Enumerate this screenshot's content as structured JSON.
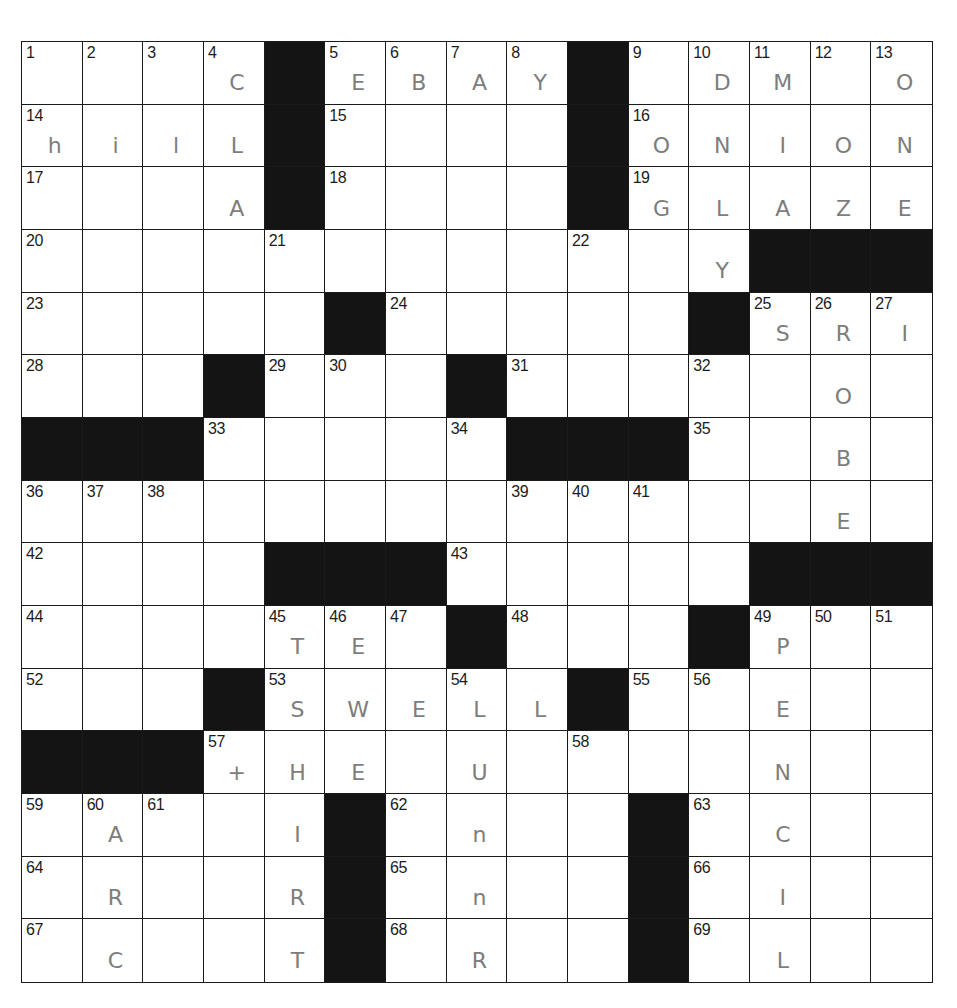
{
  "puzzle": {
    "rows": 15,
    "cols": 15,
    "colors": {
      "block": "#141414",
      "grid_line": "#1a1a1a",
      "pencil": "#7d7d7d",
      "number": "#1c1c1c"
    },
    "grid": [
      [
        {
          "n": "1",
          "v": ""
        },
        {
          "n": "2",
          "v": ""
        },
        {
          "n": "3",
          "v": ""
        },
        {
          "n": "4",
          "v": "C"
        },
        {
          "b": true
        },
        {
          "n": "5",
          "v": "E"
        },
        {
          "n": "6",
          "v": "B"
        },
        {
          "n": "7",
          "v": "A"
        },
        {
          "n": "8",
          "v": "Y"
        },
        {
          "b": true
        },
        {
          "n": "9",
          "v": ""
        },
        {
          "n": "10",
          "v": "D"
        },
        {
          "n": "11",
          "v": "M"
        },
        {
          "n": "12",
          "v": ""
        },
        {
          "n": "13",
          "v": "O"
        }
      ],
      [
        {
          "n": "14",
          "v": "h"
        },
        {
          "n": "",
          "v": "i"
        },
        {
          "n": "",
          "v": "l"
        },
        {
          "n": "",
          "v": "L"
        },
        {
          "b": true
        },
        {
          "n": "15",
          "v": ""
        },
        {
          "n": "",
          "v": ""
        },
        {
          "n": "",
          "v": ""
        },
        {
          "n": "",
          "v": ""
        },
        {
          "b": true
        },
        {
          "n": "16",
          "v": "O"
        },
        {
          "n": "",
          "v": "N"
        },
        {
          "n": "",
          "v": "I"
        },
        {
          "n": "",
          "v": "O"
        },
        {
          "n": "",
          "v": "N"
        }
      ],
      [
        {
          "n": "17",
          "v": ""
        },
        {
          "n": "",
          "v": ""
        },
        {
          "n": "",
          "v": ""
        },
        {
          "n": "",
          "v": "A"
        },
        {
          "b": true
        },
        {
          "n": "18",
          "v": ""
        },
        {
          "n": "",
          "v": ""
        },
        {
          "n": "",
          "v": ""
        },
        {
          "n": "",
          "v": ""
        },
        {
          "b": true
        },
        {
          "n": "19",
          "v": "G"
        },
        {
          "n": "",
          "v": "L"
        },
        {
          "n": "",
          "v": "A"
        },
        {
          "n": "",
          "v": "Z"
        },
        {
          "n": "",
          "v": "E"
        }
      ],
      [
        {
          "n": "20",
          "v": ""
        },
        {
          "n": "",
          "v": ""
        },
        {
          "n": "",
          "v": ""
        },
        {
          "n": "",
          "v": ""
        },
        {
          "n": "21",
          "v": ""
        },
        {
          "n": "",
          "v": ""
        },
        {
          "n": "",
          "v": ""
        },
        {
          "n": "",
          "v": ""
        },
        {
          "n": "",
          "v": ""
        },
        {
          "n": "22",
          "v": ""
        },
        {
          "n": "",
          "v": ""
        },
        {
          "n": "",
          "v": "Y"
        },
        {
          "b": true
        },
        {
          "b": true
        },
        {
          "b": true
        }
      ],
      [
        {
          "n": "23",
          "v": ""
        },
        {
          "n": "",
          "v": ""
        },
        {
          "n": "",
          "v": ""
        },
        {
          "n": "",
          "v": ""
        },
        {
          "n": "",
          "v": ""
        },
        {
          "b": true
        },
        {
          "n": "24",
          "v": ""
        },
        {
          "n": "",
          "v": ""
        },
        {
          "n": "",
          "v": ""
        },
        {
          "n": "",
          "v": ""
        },
        {
          "n": "",
          "v": ""
        },
        {
          "b": true
        },
        {
          "n": "25",
          "v": "S"
        },
        {
          "n": "26",
          "v": "R"
        },
        {
          "n": "27",
          "v": "I"
        }
      ],
      [
        {
          "n": "28",
          "v": ""
        },
        {
          "n": "",
          "v": ""
        },
        {
          "n": "",
          "v": ""
        },
        {
          "b": true
        },
        {
          "n": "29",
          "v": ""
        },
        {
          "n": "30",
          "v": ""
        },
        {
          "n": "",
          "v": ""
        },
        {
          "b": true
        },
        {
          "n": "31",
          "v": ""
        },
        {
          "n": "",
          "v": ""
        },
        {
          "n": "",
          "v": ""
        },
        {
          "n": "32",
          "v": ""
        },
        {
          "n": "",
          "v": ""
        },
        {
          "n": "",
          "v": "O"
        },
        {
          "n": "",
          "v": ""
        }
      ],
      [
        {
          "b": true
        },
        {
          "b": true
        },
        {
          "b": true
        },
        {
          "n": "33",
          "v": ""
        },
        {
          "n": "",
          "v": ""
        },
        {
          "n": "",
          "v": ""
        },
        {
          "n": "",
          "v": ""
        },
        {
          "n": "34",
          "v": ""
        },
        {
          "b": true
        },
        {
          "b": true
        },
        {
          "b": true
        },
        {
          "n": "35",
          "v": ""
        },
        {
          "n": "",
          "v": ""
        },
        {
          "n": "",
          "v": "B"
        },
        {
          "n": "",
          "v": ""
        }
      ],
      [
        {
          "n": "36",
          "v": ""
        },
        {
          "n": "37",
          "v": ""
        },
        {
          "n": "38",
          "v": ""
        },
        {
          "n": "",
          "v": ""
        },
        {
          "n": "",
          "v": ""
        },
        {
          "n": "",
          "v": ""
        },
        {
          "n": "",
          "v": ""
        },
        {
          "n": "",
          "v": ""
        },
        {
          "n": "39",
          "v": ""
        },
        {
          "n": "40",
          "v": ""
        },
        {
          "n": "41",
          "v": ""
        },
        {
          "n": "",
          "v": ""
        },
        {
          "n": "",
          "v": ""
        },
        {
          "n": "",
          "v": "E"
        },
        {
          "n": "",
          "v": ""
        }
      ],
      [
        {
          "n": "42",
          "v": ""
        },
        {
          "n": "",
          "v": ""
        },
        {
          "n": "",
          "v": ""
        },
        {
          "n": "",
          "v": ""
        },
        {
          "b": true
        },
        {
          "b": true
        },
        {
          "b": true
        },
        {
          "n": "43",
          "v": ""
        },
        {
          "n": "",
          "v": ""
        },
        {
          "n": "",
          "v": ""
        },
        {
          "n": "",
          "v": ""
        },
        {
          "n": "",
          "v": ""
        },
        {
          "b": true
        },
        {
          "b": true
        },
        {
          "b": true
        }
      ],
      [
        {
          "n": "44",
          "v": ""
        },
        {
          "n": "",
          "v": ""
        },
        {
          "n": "",
          "v": ""
        },
        {
          "n": "",
          "v": ""
        },
        {
          "n": "45",
          "v": "T"
        },
        {
          "n": "46",
          "v": "E"
        },
        {
          "n": "47",
          "v": ""
        },
        {
          "b": true
        },
        {
          "n": "48",
          "v": ""
        },
        {
          "n": "",
          "v": ""
        },
        {
          "n": "",
          "v": ""
        },
        {
          "b": true
        },
        {
          "n": "49",
          "v": "P"
        },
        {
          "n": "50",
          "v": ""
        },
        {
          "n": "51",
          "v": ""
        }
      ],
      [
        {
          "n": "52",
          "v": ""
        },
        {
          "n": "",
          "v": ""
        },
        {
          "n": "",
          "v": ""
        },
        {
          "b": true
        },
        {
          "n": "53",
          "v": "S"
        },
        {
          "n": "",
          "v": "W"
        },
        {
          "n": "",
          "v": "E"
        },
        {
          "n": "54",
          "v": "L"
        },
        {
          "n": "",
          "v": "L"
        },
        {
          "b": true
        },
        {
          "n": "55",
          "v": ""
        },
        {
          "n": "56",
          "v": ""
        },
        {
          "n": "",
          "v": "E"
        },
        {
          "n": "",
          "v": ""
        },
        {
          "n": "",
          "v": ""
        }
      ],
      [
        {
          "b": true
        },
        {
          "b": true
        },
        {
          "b": true
        },
        {
          "n": "57",
          "v": "+"
        },
        {
          "n": "",
          "v": "H"
        },
        {
          "n": "",
          "v": "E"
        },
        {
          "n": "",
          "v": ""
        },
        {
          "n": "",
          "v": "U"
        },
        {
          "n": "",
          "v": ""
        },
        {
          "n": "58",
          "v": ""
        },
        {
          "n": "",
          "v": ""
        },
        {
          "n": "",
          "v": ""
        },
        {
          "n": "",
          "v": "N"
        },
        {
          "n": "",
          "v": ""
        },
        {
          "n": "",
          "v": ""
        }
      ],
      [
        {
          "n": "59",
          "v": ""
        },
        {
          "n": "60",
          "v": "A"
        },
        {
          "n": "61",
          "v": ""
        },
        {
          "n": "",
          "v": ""
        },
        {
          "n": "",
          "v": "I"
        },
        {
          "b": true
        },
        {
          "n": "62",
          "v": ""
        },
        {
          "n": "",
          "v": "n"
        },
        {
          "n": "",
          "v": ""
        },
        {
          "n": "",
          "v": ""
        },
        {
          "b": true
        },
        {
          "n": "63",
          "v": ""
        },
        {
          "n": "",
          "v": "C"
        },
        {
          "n": "",
          "v": ""
        },
        {
          "n": "",
          "v": ""
        }
      ],
      [
        {
          "n": "64",
          "v": ""
        },
        {
          "n": "",
          "v": "R"
        },
        {
          "n": "",
          "v": ""
        },
        {
          "n": "",
          "v": ""
        },
        {
          "n": "",
          "v": "R"
        },
        {
          "b": true
        },
        {
          "n": "65",
          "v": ""
        },
        {
          "n": "",
          "v": "n"
        },
        {
          "n": "",
          "v": ""
        },
        {
          "n": "",
          "v": ""
        },
        {
          "b": true
        },
        {
          "n": "66",
          "v": ""
        },
        {
          "n": "",
          "v": "I"
        },
        {
          "n": "",
          "v": ""
        },
        {
          "n": "",
          "v": ""
        }
      ],
      [
        {
          "n": "67",
          "v": ""
        },
        {
          "n": "",
          "v": "C"
        },
        {
          "n": "",
          "v": ""
        },
        {
          "n": "",
          "v": ""
        },
        {
          "n": "",
          "v": "T"
        },
        {
          "b": true
        },
        {
          "n": "68",
          "v": ""
        },
        {
          "n": "",
          "v": "R"
        },
        {
          "n": "",
          "v": ""
        },
        {
          "n": "",
          "v": ""
        },
        {
          "b": true
        },
        {
          "n": "69",
          "v": ""
        },
        {
          "n": "",
          "v": "L"
        },
        {
          "n": "",
          "v": ""
        },
        {
          "n": "",
          "v": ""
        }
      ]
    ]
  }
}
